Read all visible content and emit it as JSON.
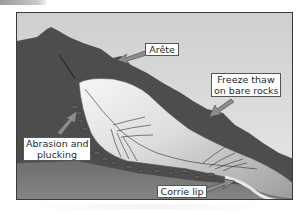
{
  "diagram": {
    "labels": {
      "arete": "Arête",
      "freeze_thaw_line1": "Freeze thaw",
      "freeze_thaw_line2": "on bare rocks",
      "abrasion_line1": "Abrasion and",
      "abrasion_line2": "plucking",
      "corrie_lip": "Corrie lip"
    },
    "colors": {
      "sky": "#d8d8d8",
      "mountain": "#4a4a4a",
      "valley_floor": "#7a7a7a",
      "glacier_light": "#f2f2f2",
      "glacier_shadow": "#a8a8a8",
      "arrow_fill": "#8c8c8c",
      "frame": "#3a3a3a"
    }
  }
}
